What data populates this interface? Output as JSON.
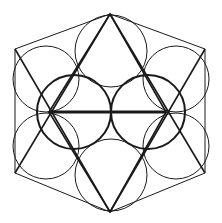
{
  "diagram": {
    "title": "",
    "background": "#ffffff",
    "stroke_color": "#1a1a1a",
    "hexagon": [
      [
        110,
        14
      ],
      [
        205,
        49
      ],
      [
        205,
        173
      ],
      [
        110,
        212
      ],
      [
        15,
        173
      ],
      [
        15,
        49
      ]
    ],
    "triangles": [
      {
        "name": "up-triangle",
        "points": [
          [
            110,
            14
          ],
          [
            166,
            112
          ],
          [
            49,
            112
          ]
        ]
      },
      {
        "name": "down-triangle",
        "points": [
          [
            110,
            212
          ],
          [
            166,
            112
          ],
          [
            49,
            112
          ]
        ]
      }
    ],
    "cross_lines": [
      {
        "x1": 15,
        "y1": 49,
        "x2": 110,
        "y2": 212
      },
      {
        "x1": 205,
        "y1": 49,
        "x2": 110,
        "y2": 212
      },
      {
        "x1": 15,
        "y1": 173,
        "x2": 110,
        "y2": 14
      },
      {
        "x1": 205,
        "y1": 173,
        "x2": 110,
        "y2": 14
      }
    ],
    "center_line": {
      "x1": 49,
      "y1": 112,
      "x2": 166,
      "y2": 112
    },
    "bold_circles": [
      {
        "cx": 74,
        "cy": 112,
        "r": 37
      },
      {
        "cx": 148,
        "cy": 112,
        "r": 37
      }
    ],
    "circles": [
      {
        "cx": 111,
        "cy": 51,
        "r": 36
      },
      {
        "cx": 111,
        "cy": 175,
        "r": 36
      },
      {
        "cx": 46,
        "cy": 79,
        "r": 33
      },
      {
        "cx": 46,
        "cy": 146,
        "r": 33
      },
      {
        "cx": 176,
        "cy": 79,
        "r": 33
      },
      {
        "cx": 176,
        "cy": 146,
        "r": 33
      }
    ]
  }
}
